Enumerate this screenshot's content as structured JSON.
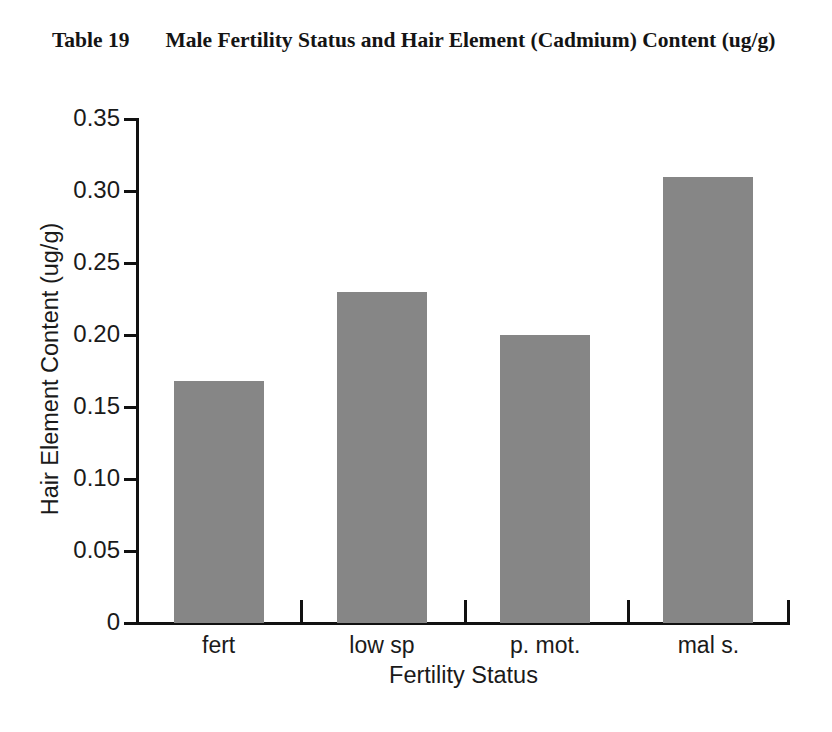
{
  "caption": {
    "number": "Table 19",
    "text": "Male Fertility Status and Hair Element (Cadmium) Content (ug/g)"
  },
  "chart_data": {
    "type": "bar",
    "title": "Male Fertility Status and Hair Element (Cadmium) Content (ug/g)",
    "categories": [
      "fert",
      "low sp",
      "p. mot.",
      "mal s."
    ],
    "values": [
      0.168,
      0.23,
      0.2,
      0.31
    ],
    "series": [
      {
        "name": "Hair Element Content (ug/g)",
        "values": [
          0.168,
          0.23,
          0.2,
          0.31
        ]
      }
    ],
    "xlabel": "Fertility Status",
    "ylabel": "Hair Element Content (ug/g)",
    "ylim": [
      0,
      0.35
    ],
    "ytick_labels": [
      "0",
      "0.05",
      "0.10",
      "0.15",
      "0.20",
      "0.25",
      "0.30",
      "0.35"
    ],
    "ytick_values": [
      0,
      0.05,
      0.1,
      0.15,
      0.2,
      0.25,
      0.3,
      0.35
    ],
    "grid": false,
    "legend": null,
    "bar_color": "#868686",
    "axis_color": "#111111"
  }
}
